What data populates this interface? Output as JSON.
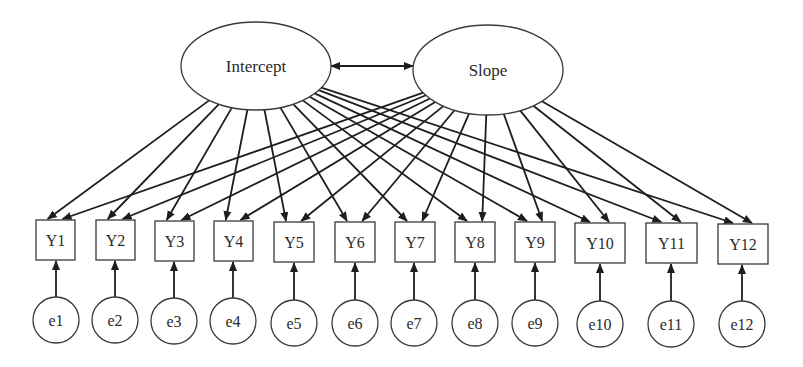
{
  "diagram": {
    "type": "latent growth curve model path diagram",
    "latent_factors": [
      {
        "id": "intercept",
        "label": "Intercept",
        "cx": 256,
        "cy": 66,
        "rx": 75,
        "ry": 44
      },
      {
        "id": "slope",
        "label": "Slope",
        "cx": 488,
        "cy": 70,
        "rx": 75,
        "ry": 45
      }
    ],
    "covariance": {
      "from": "intercept",
      "to": "slope",
      "x1": 331,
      "y1": 66,
      "x2": 413,
      "y2": 66,
      "bidirectional": true
    },
    "observed": [
      {
        "id": "Y1",
        "label": "Y1",
        "x": 36,
        "y": 220,
        "w": 39,
        "h": 40
      },
      {
        "id": "Y2",
        "label": "Y2",
        "x": 96,
        "y": 220,
        "w": 39,
        "h": 40
      },
      {
        "id": "Y3",
        "label": "Y3",
        "x": 155,
        "y": 221,
        "w": 39,
        "h": 40
      },
      {
        "id": "Y4",
        "label": "Y4",
        "x": 214,
        "y": 221,
        "w": 39,
        "h": 40
      },
      {
        "id": "Y5",
        "label": "Y5",
        "x": 274,
        "y": 222,
        "w": 40,
        "h": 40
      },
      {
        "id": "Y6",
        "label": "Y6",
        "x": 335,
        "y": 222,
        "w": 40,
        "h": 40
      },
      {
        "id": "Y7",
        "label": "Y7",
        "x": 395,
        "y": 222,
        "w": 40,
        "h": 40
      },
      {
        "id": "Y8",
        "label": "Y8",
        "x": 455,
        "y": 222,
        "w": 40,
        "h": 40
      },
      {
        "id": "Y9",
        "label": "Y9",
        "x": 515,
        "y": 222,
        "w": 40,
        "h": 40
      },
      {
        "id": "Y10",
        "label": "Y10",
        "x": 575,
        "y": 223,
        "w": 50,
        "h": 40
      },
      {
        "id": "Y11",
        "label": "Y11",
        "x": 646,
        "y": 223,
        "w": 51,
        "h": 40
      },
      {
        "id": "Y12",
        "label": "Y12",
        "x": 718,
        "y": 224,
        "w": 50,
        "h": 40
      }
    ],
    "errors": [
      {
        "id": "e1",
        "label": "e1",
        "cx": 56,
        "cy": 320,
        "r": 23
      },
      {
        "id": "e2",
        "label": "e2",
        "cx": 115,
        "cy": 320,
        "r": 23
      },
      {
        "id": "e3",
        "label": "e3",
        "cx": 174,
        "cy": 321,
        "r": 23
      },
      {
        "id": "e4",
        "label": "e4",
        "cx": 233,
        "cy": 321,
        "r": 23
      },
      {
        "id": "e5",
        "label": "e5",
        "cx": 294,
        "cy": 323,
        "r": 23
      },
      {
        "id": "e6",
        "label": "e6",
        "cx": 355,
        "cy": 323,
        "r": 23
      },
      {
        "id": "e7",
        "label": "e7",
        "cx": 414,
        "cy": 323,
        "r": 23
      },
      {
        "id": "e8",
        "label": "e8",
        "cx": 475,
        "cy": 323,
        "r": 23
      },
      {
        "id": "e9",
        "label": "e9",
        "cx": 535,
        "cy": 323,
        "r": 23
      },
      {
        "id": "e10",
        "label": "e10",
        "cx": 600,
        "cy": 324,
        "r": 23
      },
      {
        "id": "e11",
        "label": "e11",
        "cx": 671,
        "cy": 324,
        "r": 23
      },
      {
        "id": "e12",
        "label": "e12",
        "cx": 742,
        "cy": 324,
        "r": 23
      }
    ],
    "loadings": {
      "intercept_targets": [
        "Y1",
        "Y2",
        "Y3",
        "Y4",
        "Y5",
        "Y6",
        "Y7",
        "Y8",
        "Y9",
        "Y10",
        "Y11",
        "Y12"
      ],
      "slope_targets": [
        "Y1",
        "Y2",
        "Y3",
        "Y4",
        "Y5",
        "Y6",
        "Y7",
        "Y8",
        "Y9",
        "Y10",
        "Y11",
        "Y12"
      ]
    },
    "colors": {
      "stroke": "#1e1e1e",
      "node_border": "#3a3a3a",
      "text": "#2b2b2b",
      "background": "#ffffff"
    }
  }
}
